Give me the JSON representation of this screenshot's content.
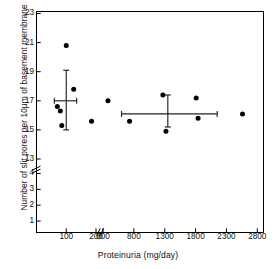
{
  "figure": {
    "background": "#ffffff",
    "ink": "#000000"
  },
  "axes": {
    "y": {
      "title": "Number of slit pores per 10μm of basement membrane",
      "ticks": [
        "1",
        "2",
        "3",
        "4",
        "13",
        "15",
        "17",
        "19",
        "21",
        "23"
      ],
      "has_break": true,
      "break_between": [
        "4",
        "13"
      ]
    },
    "x": {
      "title_main": "Proteinuria",
      "title_unit": "(mg/day)",
      "title": "Proteinuria  (mg/day)",
      "ticks": [
        "100",
        "200",
        "300",
        "800",
        "1300",
        "1800",
        "2300",
        "2800"
      ],
      "has_break": true,
      "break_between": [
        "200",
        "300"
      ]
    }
  },
  "chart_data": {
    "type": "scatter",
    "title": "",
    "xlabel": "Proteinuria (mg/day)",
    "ylabel": "Number of slit pores per 10μm of basement membrane",
    "xlim": [
      0,
      2900
    ],
    "ylim": [
      0.5,
      23
    ],
    "grid": false,
    "legend": "none",
    "axis_breaks": {
      "x": {
        "between": [
          200,
          300
        ]
      },
      "y": {
        "between": [
          4,
          13
        ]
      }
    },
    "x_ticks": [
      100,
      200,
      300,
      800,
      1300,
      1800,
      2300,
      2800
    ],
    "y_ticks": [
      1,
      2,
      3,
      4,
      13,
      15,
      17,
      19,
      21,
      23
    ],
    "series": [
      {
        "name": "Low proteinuria group",
        "marker": "filled-circle",
        "color": "#000000",
        "points": [
          {
            "x": 70,
            "y": 16.6
          },
          {
            "x": 80,
            "y": 16.3
          },
          {
            "x": 85,
            "y": 15.3
          },
          {
            "x": 100,
            "y": 20.8
          },
          {
            "x": 125,
            "y": 17.8
          },
          {
            "x": 185,
            "y": 15.6
          }
        ]
      },
      {
        "name": "High proteinuria group",
        "marker": "filled-circle",
        "color": "#000000",
        "points": [
          {
            "x": 380,
            "y": 17.0
          },
          {
            "x": 730,
            "y": 15.6
          },
          {
            "x": 1270,
            "y": 17.4
          },
          {
            "x": 1320,
            "y": 14.9
          },
          {
            "x": 1810,
            "y": 17.2
          },
          {
            "x": 1840,
            "y": 15.8
          },
          {
            "x": 2560,
            "y": 16.1
          }
        ]
      }
    ],
    "summary_markers": [
      {
        "name": "Low proteinuria mean ± SD",
        "x_mean": 100,
        "y_mean": 17.0,
        "y_low": 15.0,
        "y_high": 19.1,
        "x_low": 60,
        "x_high": 135
      },
      {
        "name": "High proteinuria mean ± SD",
        "x_mean": 1350,
        "y_mean": 16.1,
        "y_low": 15.2,
        "y_high": 17.4,
        "x_low": 600,
        "x_high": 2150
      }
    ]
  }
}
